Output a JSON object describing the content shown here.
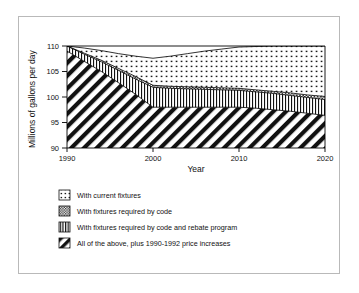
{
  "figure": {
    "frame_border_color": "#b9b9b9",
    "background": "#ffffff",
    "line_color": "#000000"
  },
  "chart_data": {
    "type": "area",
    "stacked": true,
    "title": "",
    "subtitle": "",
    "xlabel": "Year",
    "ylabel": "Millions of gallons per day",
    "xlim": [
      1990,
      2020
    ],
    "ylim": [
      90,
      110
    ],
    "xticks": [
      1990,
      2000,
      2010,
      2020
    ],
    "xtick_labels": [
      "1990",
      "2000",
      "2010",
      "2020"
    ],
    "yticks": [
      90,
      95,
      100,
      105,
      110
    ],
    "ytick_labels": [
      "90",
      "95",
      "100",
      "105",
      "110"
    ],
    "grid": false,
    "legend_position": "below",
    "x": [
      1990,
      1992,
      1994,
      1996,
      1998,
      2000,
      2002,
      2004,
      2006,
      2008,
      2010,
      2012,
      2014,
      2016,
      2018,
      2020
    ],
    "boundaries": {
      "total_demand_top": [
        110.0,
        109.6,
        109.1,
        108.5,
        108.0,
        107.6,
        108.0,
        108.5,
        109.0,
        109.4,
        109.8,
        109.9,
        110.0,
        110.0,
        110.0,
        110.0
      ],
      "with_current_fixtures_lower": [
        110.0,
        108.6,
        107.2,
        105.6,
        104.0,
        102.3,
        102.1,
        102.0,
        101.9,
        101.8,
        101.7,
        101.4,
        101.1,
        100.8,
        100.4,
        100.1
      ],
      "with_code_lower": [
        110.0,
        108.4,
        106.9,
        105.2,
        103.5,
        101.9,
        101.7,
        101.6,
        101.5,
        101.4,
        101.3,
        101.0,
        100.7,
        100.3,
        99.9,
        99.5
      ],
      "with_code_and_rebate_lower": [
        109.0,
        107.0,
        105.0,
        102.8,
        100.5,
        98.0,
        98.0,
        98.0,
        98.0,
        98.0,
        98.0,
        97.8,
        97.5,
        97.2,
        96.8,
        96.4
      ],
      "baseline": [
        90,
        90,
        90,
        90,
        90,
        90,
        90,
        90,
        90,
        90,
        90,
        90,
        90,
        90,
        90,
        90
      ]
    },
    "series": [
      {
        "name": "With current fixtures",
        "pattern": "dotted",
        "values": [
          0.0,
          1.0,
          1.9,
          2.9,
          4.0,
          5.3,
          5.9,
          6.5,
          7.1,
          7.6,
          8.1,
          8.5,
          8.9,
          9.2,
          9.6,
          9.9
        ]
      },
      {
        "name": "With fixtures required by code",
        "pattern": "checkered",
        "values": [
          0.0,
          0.2,
          0.3,
          0.4,
          0.5,
          0.4,
          0.4,
          0.4,
          0.4,
          0.4,
          0.4,
          0.4,
          0.4,
          0.5,
          0.5,
          0.6
        ]
      },
      {
        "name": "With fixtures required by code and rebate program",
        "pattern": "vertical-lines",
        "values": [
          1.0,
          1.4,
          1.9,
          2.4,
          3.0,
          3.9,
          3.7,
          3.6,
          3.5,
          3.4,
          3.3,
          3.2,
          3.2,
          3.1,
          3.1,
          3.1
        ]
      },
      {
        "name": "All of the above, plus 1990-1992 price increases",
        "pattern": "diagonal-hatch",
        "values": [
          19.0,
          17.0,
          15.0,
          12.8,
          10.5,
          8.0,
          8.0,
          8.0,
          8.0,
          8.0,
          8.0,
          7.8,
          7.5,
          7.2,
          6.8,
          6.4
        ]
      }
    ]
  },
  "legend": {
    "items": [
      {
        "label": "With current fixtures",
        "swatch": "dotted-swatch"
      },
      {
        "label": "With fixtures required by code",
        "swatch": "checkered-swatch"
      },
      {
        "label": "With fixtures required by code and rebate program",
        "swatch": "vertical-lines-swatch"
      },
      {
        "label": "All of the above, plus 1990-1992 price increases",
        "swatch": "diagonal-hatch-swatch"
      }
    ]
  }
}
